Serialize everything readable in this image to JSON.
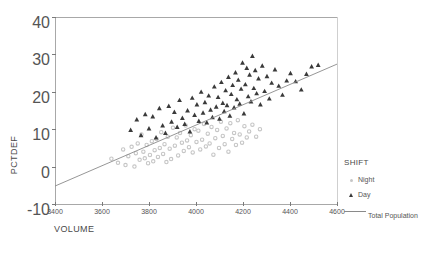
{
  "chart_data": {
    "type": "scatter",
    "title": "",
    "xlabel": "VOLUME",
    "ylabel": "PCTDEF",
    "xlim": [
      3400,
      4600
    ],
    "ylim": [
      -10,
      40
    ],
    "xticks": [
      3400,
      3600,
      3800,
      4000,
      4200,
      4400,
      4600
    ],
    "yticks": [
      -10,
      0,
      10,
      20,
      30,
      40
    ],
    "grid": false,
    "legend_position": "right",
    "legend_title": "SHIFT",
    "series": [
      {
        "name": "Night",
        "marker": "circle",
        "color": "#c6c6c6",
        "points": [
          [
            3640,
            2.1
          ],
          [
            3668,
            1.0
          ],
          [
            3690,
            4.6
          ],
          [
            3700,
            0.4
          ],
          [
            3712,
            2.8
          ],
          [
            3726,
            5.3
          ],
          [
            3738,
            0.0
          ],
          [
            3744,
            3.6
          ],
          [
            3752,
            6.2
          ],
          [
            3760,
            1.8
          ],
          [
            3768,
            8.6
          ],
          [
            3776,
            4.0
          ],
          [
            3782,
            2.2
          ],
          [
            3790,
            5.8
          ],
          [
            3796,
            0.9
          ],
          [
            3804,
            3.1
          ],
          [
            3812,
            6.8
          ],
          [
            3818,
            1.4
          ],
          [
            3824,
            4.4
          ],
          [
            3832,
            7.4
          ],
          [
            3838,
            2.6
          ],
          [
            3846,
            5.0
          ],
          [
            3852,
            9.2
          ],
          [
            3860,
            3.4
          ],
          [
            3866,
            6.0
          ],
          [
            3874,
            1.2
          ],
          [
            3880,
            8.0
          ],
          [
            3888,
            4.8
          ],
          [
            3894,
            2.0
          ],
          [
            3902,
            10.4
          ],
          [
            3910,
            5.6
          ],
          [
            3918,
            7.8
          ],
          [
            3924,
            3.0
          ],
          [
            3932,
            9.0
          ],
          [
            3940,
            6.4
          ],
          [
            3948,
            4.2
          ],
          [
            3956,
            11.0
          ],
          [
            3962,
            7.0
          ],
          [
            3970,
            5.2
          ],
          [
            3978,
            8.4
          ],
          [
            3986,
            3.8
          ],
          [
            3994,
            10.0
          ],
          [
            4002,
            6.6
          ],
          [
            4010,
            9.6
          ],
          [
            4018,
            4.6
          ],
          [
            4026,
            7.2
          ],
          [
            4034,
            11.4
          ],
          [
            4042,
            5.4
          ],
          [
            4050,
            8.8
          ],
          [
            4058,
            6.2
          ],
          [
            4066,
            10.6
          ],
          [
            4074,
            3.2
          ],
          [
            4082,
            7.6
          ],
          [
            4090,
            9.8
          ],
          [
            4098,
            5.0
          ],
          [
            4106,
            12.0
          ],
          [
            4114,
            8.2
          ],
          [
            4122,
            6.0
          ],
          [
            4130,
            10.2
          ],
          [
            4138,
            4.0
          ],
          [
            4146,
            11.6
          ],
          [
            4154,
            7.4
          ],
          [
            4162,
            9.0
          ],
          [
            4170,
            5.8
          ],
          [
            4178,
            12.4
          ],
          [
            4186,
            8.6
          ],
          [
            4196,
            6.4
          ],
          [
            4206,
            10.8
          ],
          [
            4216,
            7.8
          ],
          [
            4226,
            9.4
          ],
          [
            4240,
            11.2
          ],
          [
            4256,
            8.0
          ],
          [
            4272,
            10.0
          ]
        ]
      },
      {
        "name": "Day",
        "marker": "triangle",
        "color": "#3a3a3a",
        "points": [
          [
            3722,
            9.8
          ],
          [
            3748,
            12.6
          ],
          [
            3766,
            8.4
          ],
          [
            3784,
            14.0
          ],
          [
            3800,
            10.2
          ],
          [
            3816,
            13.4
          ],
          [
            3830,
            7.8
          ],
          [
            3844,
            15.6
          ],
          [
            3858,
            11.0
          ],
          [
            3870,
            9.0
          ],
          [
            3884,
            16.2
          ],
          [
            3896,
            12.0
          ],
          [
            3908,
            14.6
          ],
          [
            3920,
            10.6
          ],
          [
            3930,
            17.8
          ],
          [
            3942,
            13.0
          ],
          [
            3952,
            11.4
          ],
          [
            3964,
            15.0
          ],
          [
            3974,
            9.4
          ],
          [
            3984,
            18.4
          ],
          [
            3994,
            13.8
          ],
          [
            4004,
            16.6
          ],
          [
            4012,
            12.2
          ],
          [
            4022,
            20.0
          ],
          [
            4030,
            14.4
          ],
          [
            4038,
            17.2
          ],
          [
            4046,
            11.8
          ],
          [
            4054,
            19.0
          ],
          [
            4062,
            15.2
          ],
          [
            4070,
            13.2
          ],
          [
            4078,
            21.4
          ],
          [
            4086,
            16.0
          ],
          [
            4094,
            18.6
          ],
          [
            4100,
            12.8
          ],
          [
            4108,
            22.6
          ],
          [
            4114,
            17.0
          ],
          [
            4120,
            14.8
          ],
          [
            4126,
            20.4
          ],
          [
            4132,
            16.4
          ],
          [
            4138,
            24.0
          ],
          [
            4144,
            13.6
          ],
          [
            4150,
            19.4
          ],
          [
            4156,
            21.8
          ],
          [
            4162,
            15.8
          ],
          [
            4168,
            25.2
          ],
          [
            4174,
            18.0
          ],
          [
            4180,
            23.2
          ],
          [
            4186,
            16.8
          ],
          [
            4192,
            20.8
          ],
          [
            4198,
            27.8
          ],
          [
            4204,
            14.2
          ],
          [
            4210,
            22.0
          ],
          [
            4216,
            26.4
          ],
          [
            4222,
            18.8
          ],
          [
            4228,
            24.6
          ],
          [
            4234,
            17.4
          ],
          [
            4240,
            29.6
          ],
          [
            4246,
            21.0
          ],
          [
            4252,
            25.8
          ],
          [
            4258,
            19.6
          ],
          [
            4266,
            23.6
          ],
          [
            4274,
            16.6
          ],
          [
            4282,
            27.0
          ],
          [
            4292,
            20.2
          ],
          [
            4302,
            24.2
          ],
          [
            4312,
            18.2
          ],
          [
            4322,
            22.4
          ],
          [
            4336,
            26.0
          ],
          [
            4352,
            21.6
          ],
          [
            4368,
            19.2
          ],
          [
            4386,
            23.0
          ],
          [
            4402,
            25.0
          ],
          [
            4424,
            22.8
          ],
          [
            4448,
            20.6
          ],
          [
            4470,
            24.8
          ],
          [
            4492,
            26.8
          ],
          [
            4520,
            27.2
          ]
        ]
      }
    ],
    "fit_line": {
      "name": "Total Population",
      "color": "#8a8a8a",
      "x_start": 3400,
      "y_start": -5.2,
      "x_end": 4600,
      "y_end": 27.4
    }
  },
  "legend": {
    "title": "SHIFT",
    "items": [
      {
        "label": "Night",
        "marker": "circle-icon"
      },
      {
        "label": "Day",
        "marker": "triangle-icon"
      }
    ],
    "line_item": {
      "label": "Total Population"
    }
  },
  "axes": {
    "x_title": "VOLUME",
    "y_title": "PCTDEF",
    "x_tick_labels": [
      "3400",
      "3600",
      "3800",
      "4000",
      "4200",
      "4400",
      "4600"
    ],
    "y_tick_labels": [
      "-10",
      "0",
      "10",
      "20",
      "30",
      "40"
    ]
  }
}
